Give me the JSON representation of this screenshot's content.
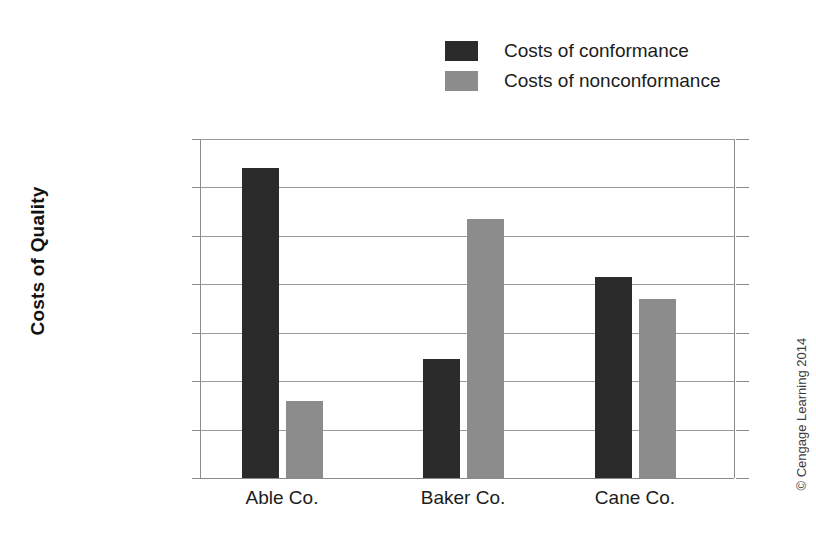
{
  "chart_data": {
    "type": "bar",
    "title": "",
    "xlabel": "",
    "ylabel": "Costs of Quality",
    "categories": [
      "Able Co.",
      "Baker Co.",
      "Cane Co."
    ],
    "series": [
      {
        "name": "Costs of conformance",
        "color": "#2b2b2b",
        "values": [
          1280000,
          490000,
          830000
        ]
      },
      {
        "name": "Costs of nonconformance",
        "color": "#8c8c8c",
        "values": [
          320000,
          1070000,
          740000
        ]
      }
    ],
    "ylim": [
      0,
      1400000
    ],
    "ytick_values": [
      1400000,
      1200000,
      1000000,
      800000,
      600000,
      400000,
      200000,
      0
    ],
    "ytick_labels": [
      "$1,400,000",
      "1,200,000",
      "1,000,000",
      "800,000",
      "600,000",
      "400,000",
      "200,000",
      "0"
    ],
    "grid": true,
    "legend_position": "top-right"
  },
  "legend": {
    "items": [
      {
        "label": "Costs of conformance",
        "color": "#2b2b2b"
      },
      {
        "label": "Costs of nonconformance",
        "color": "#8c8c8c"
      }
    ]
  },
  "credit": {
    "text": "© Cengage Learning 2014"
  }
}
